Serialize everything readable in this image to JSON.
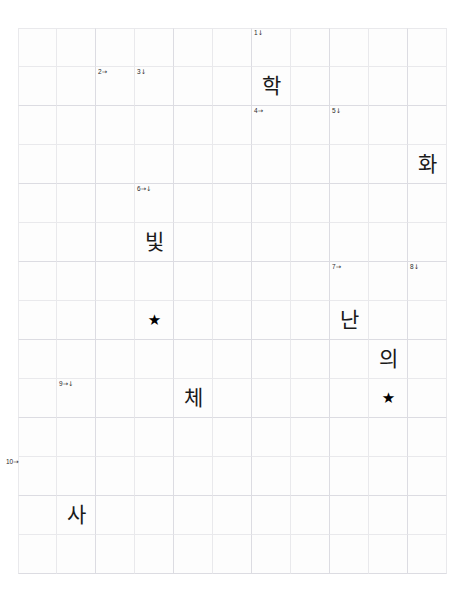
{
  "puzzle": {
    "title": "Korean crossword grid",
    "grid": {
      "columns": 11,
      "rows": 14,
      "cell_size": 39,
      "origin_x": 18,
      "origin_y": 28,
      "line_color": "#e9e9ec",
      "background_color": "#ffffff"
    },
    "clues": [
      {
        "id": "clue-1",
        "number": "1",
        "arrow": "↓",
        "col": 6,
        "row": 0,
        "offset_x": 2,
        "offset_y": 2
      },
      {
        "id": "clue-2",
        "number": "2",
        "arrow": "→",
        "col": 2,
        "row": 1,
        "offset_x": 2,
        "offset_y": 2
      },
      {
        "id": "clue-3",
        "number": "3",
        "arrow": "↓",
        "col": 3,
        "row": 1,
        "offset_x": 2,
        "offset_y": 2
      },
      {
        "id": "clue-4",
        "number": "4",
        "arrow": "→",
        "col": 6,
        "row": 2,
        "offset_x": 2,
        "offset_y": 2
      },
      {
        "id": "clue-5",
        "number": "5",
        "arrow": "↓",
        "col": 8,
        "row": 2,
        "offset_x": 2,
        "offset_y": 2
      },
      {
        "id": "clue-6",
        "number": "6",
        "arrow": "→↓",
        "col": 3,
        "row": 4,
        "offset_x": 2,
        "offset_y": 2
      },
      {
        "id": "clue-7",
        "number": "7",
        "arrow": "→",
        "col": 8,
        "row": 6,
        "offset_x": 2,
        "offset_y": 2
      },
      {
        "id": "clue-8",
        "number": "8",
        "arrow": "↓",
        "col": 10,
        "row": 6,
        "offset_x": 2,
        "offset_y": 2
      },
      {
        "id": "clue-9",
        "number": "9",
        "arrow": "→↓",
        "col": 1,
        "row": 9,
        "offset_x": 2,
        "offset_y": 2
      },
      {
        "id": "clue-10",
        "number": "10",
        "arrow": "→",
        "col": 0,
        "row": 11,
        "offset_x": -12,
        "offset_y": 2
      }
    ],
    "entries": [
      {
        "id": "entry-hak",
        "text": "학",
        "col": 6,
        "row": 1
      },
      {
        "id": "entry-hwa",
        "text": "화",
        "col": 10,
        "row": 3
      },
      {
        "id": "entry-bit",
        "text": "빛",
        "col": 3,
        "row": 5
      },
      {
        "id": "entry-nan",
        "text": "난",
        "col": 8,
        "row": 7
      },
      {
        "id": "entry-ui",
        "text": "의",
        "col": 9,
        "row": 8
      },
      {
        "id": "entry-che",
        "text": "체",
        "col": 4,
        "row": 9
      },
      {
        "id": "entry-sa",
        "text": "사",
        "col": 1,
        "row": 12
      }
    ],
    "stars": [
      {
        "id": "star-left",
        "glyph": "★",
        "col": 3,
        "row": 7
      },
      {
        "id": "star-right",
        "glyph": "★",
        "col": 9,
        "row": 9
      }
    ]
  }
}
